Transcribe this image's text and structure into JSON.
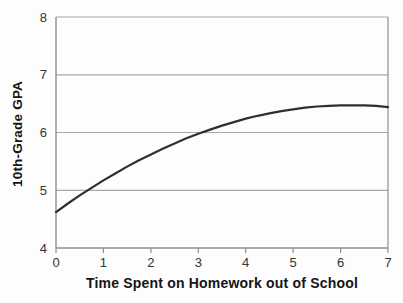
{
  "figure": {
    "background": "#fdfdfd"
  },
  "chart_data": {
    "type": "line",
    "title": "",
    "xlabel": "Time Spent on Homework out of School",
    "ylabel": "10th-Grade GPA",
    "xlim": [
      0,
      7
    ],
    "ylim": [
      4,
      8
    ],
    "x_ticks": [
      0,
      1,
      2,
      3,
      4,
      5,
      6,
      7
    ],
    "y_ticks": [
      4,
      5,
      6,
      7,
      8
    ],
    "grid": "horizontal-only",
    "legend": "none",
    "series": [
      {
        "name": "GPA vs homework hours",
        "x": [
          0,
          0.25,
          0.5,
          0.75,
          1,
          1.25,
          1.5,
          1.75,
          2,
          2.25,
          2.5,
          2.75,
          3,
          3.25,
          3.5,
          3.75,
          4,
          4.25,
          4.5,
          4.75,
          5,
          5.25,
          5.5,
          5.75,
          6,
          6.25,
          6.5,
          6.75,
          7
        ],
        "y": [
          4.62,
          4.77,
          4.91,
          5.04,
          5.17,
          5.29,
          5.41,
          5.52,
          5.62,
          5.72,
          5.81,
          5.9,
          5.98,
          6.05,
          6.12,
          6.18,
          6.24,
          6.29,
          6.33,
          6.37,
          6.4,
          6.43,
          6.45,
          6.46,
          6.47,
          6.47,
          6.47,
          6.46,
          6.44
        ],
        "color": "#2f2f2f",
        "stroke_width": 2.2
      }
    ],
    "colors": {
      "gridline": "#a9a9a9",
      "axis": "#8f8f8f",
      "tick_text": "#333333",
      "label_text": "#151515"
    },
    "layout": {
      "plot_left": 56,
      "plot_right": 388,
      "plot_top": 17,
      "plot_bottom": 248,
      "tick_length": 5
    }
  }
}
